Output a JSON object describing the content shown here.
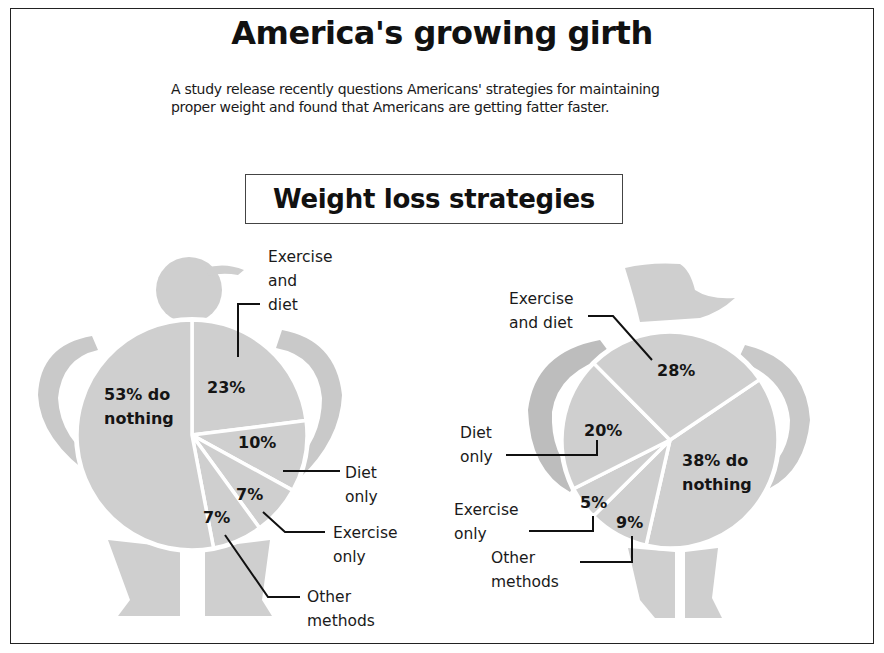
{
  "header": {
    "title": "America's growing girth",
    "subtitle_lines": [
      "A study release recently questions Americans' strategies for maintaining",
      "proper weight and found that Americans are getting fatter faster."
    ],
    "section_title": "Weight loss strategies"
  },
  "colors": {
    "figure_fill": "#cfcfcf",
    "arm_fill": "#c9c9c9",
    "slice_gap": "#ffffff",
    "text": "#151515",
    "frame": "#222222"
  },
  "chart_data": [
    {
      "type": "pie",
      "title": "Weight loss strategies (male figure)",
      "figure": "man",
      "categories": [
        "Exercise and diet",
        "Diet only",
        "Exercise only",
        "Other methods",
        "Do nothing"
      ],
      "values": [
        23,
        10,
        7,
        7,
        53
      ],
      "slice_labels": [
        "23%",
        "10%",
        "7%",
        "7%",
        "53% do nothing"
      ],
      "callouts": [
        "Exercise and diet",
        "Diet only",
        "Exercise only",
        "Other methods"
      ],
      "units": "%"
    },
    {
      "type": "pie",
      "title": "Weight loss strategies (female figure)",
      "figure": "woman",
      "categories": [
        "Do nothing",
        "Other methods",
        "Exercise only",
        "Diet only",
        "Exercise and diet"
      ],
      "values": [
        38,
        9,
        5,
        20,
        28
      ],
      "slice_labels": [
        "38% do nothing",
        "9%",
        "5%",
        "20%",
        "28%"
      ],
      "callouts": [
        "Exercise and diet",
        "Diet only",
        "Exercise only",
        "Other methods"
      ],
      "units": "%"
    }
  ],
  "left_labels": {
    "nothing_l1": "53% do",
    "nothing_l2": "nothing",
    "ex_diet_pct": "23%",
    "diet_pct": "10%",
    "ex_pct": "7%",
    "other_pct": "7%",
    "ex_diet_l1": "Exercise",
    "ex_diet_l2": "and",
    "ex_diet_l3": "diet",
    "diet_l1": "Diet",
    "diet_l2": "only",
    "ex_l1": "Exercise",
    "ex_l2": "only",
    "other_l1": "Other",
    "other_l2": "methods"
  },
  "right_labels": {
    "nothing_l1": "38% do",
    "nothing_l2": "nothing",
    "ex_diet_pct": "28%",
    "diet_pct": "20%",
    "ex_pct": "5%",
    "other_pct": "9%",
    "ex_diet_l1": "Exercise",
    "ex_diet_l2": "and diet",
    "diet_l1": "Diet",
    "diet_l2": "only",
    "ex_l1": "Exercise",
    "ex_l2": "only",
    "other_l1": "Other",
    "other_l2": "methods"
  }
}
